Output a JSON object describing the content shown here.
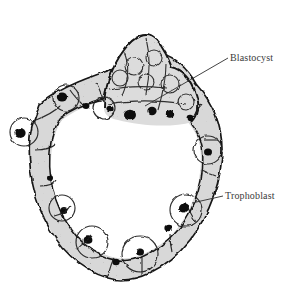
{
  "figure": {
    "background_color": "#ffffff",
    "ink_color": "#1a1a1a",
    "label_color": "#3b3b3b",
    "width": 290,
    "height": 292
  },
  "annotations": [
    {
      "id": "blastocyst",
      "label": "Blastocyst",
      "label_x": 230,
      "label_y": 52,
      "leader_from_x": 228,
      "leader_from_y": 58,
      "leader_to_x": 145,
      "leader_to_y": 106,
      "describes": "inner cell mass / embryoblast mound at top center"
    },
    {
      "id": "trophoblast",
      "label": "Trophoblast",
      "label_x": 225,
      "label_y": 190,
      "leader_from_x": 223,
      "leader_from_y": 196,
      "leader_to_x": 192,
      "leader_to_y": 203,
      "describes": "outer cell layer forming the wall of the vesicle"
    }
  ],
  "structures": {
    "blastocoel": {
      "name": "blastocoel cavity",
      "fill": "#ffffff",
      "center_x": 112,
      "center_y": 168
    },
    "inner_cell_mass": {
      "name": "inner cell mass",
      "center_x": 140,
      "center_y": 75
    },
    "zona_remnants": {
      "name": "zona pellucida wisps",
      "region": "top and upper-right"
    }
  },
  "icons": {
    "leader_line": "leader-line-icon",
    "cell_nucleus": "nucleus-icon"
  }
}
